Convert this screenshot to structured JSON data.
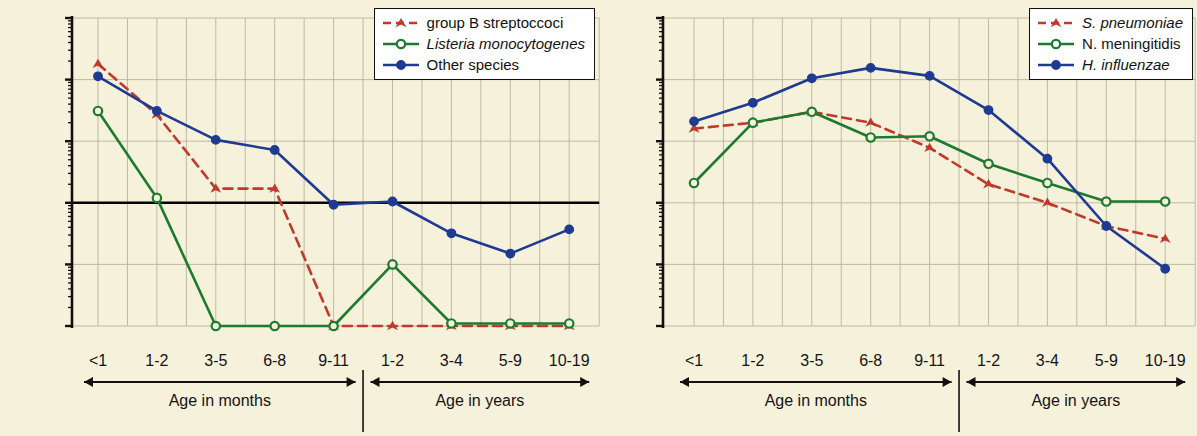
{
  "figure": {
    "background_color": "#f6f1db",
    "ylabel": "Incidence/100,000",
    "yticks": [
      "1000",
      "100",
      "10",
      "1",
      "0.1",
      "0.01"
    ],
    "ylim": [
      0.01,
      1000
    ],
    "group_label_months": "Age in months",
    "group_label_years": "Age in years",
    "categories_months": [
      "<1",
      "1-2",
      "3-5",
      "6-8",
      "9-11"
    ],
    "categories_years": [
      "1-2",
      "3-4",
      "5-9",
      "10-19"
    ],
    "colors": {
      "red": "#c0392b",
      "green": "#1d7a2e",
      "blue": "#1f3a93",
      "grid": "#b9b29a",
      "axis": "#111111",
      "reference_line": "#000000"
    }
  },
  "chart_data": [
    {
      "type": "line",
      "panel": "left",
      "title": "",
      "xlabel": "Age in months / Age in years",
      "ylabel": "Incidence/100,000",
      "log_y": true,
      "ylim": [
        0.01,
        1000
      ],
      "yticks": [
        0.01,
        0.1,
        1,
        10,
        100,
        1000
      ],
      "grid": true,
      "reference_line_y": 1,
      "legend_position": "top-right",
      "categories": [
        "<1",
        "1-2",
        "3-5",
        "6-8",
        "9-11",
        "1-2",
        "3-4",
        "5-9",
        "10-19"
      ],
      "category_groups": [
        "months",
        "months",
        "months",
        "months",
        "months",
        "years",
        "years",
        "years",
        "years"
      ],
      "series": [
        {
          "name": "group B streptoccoci",
          "color": "#c0392b",
          "line_style": "dashed",
          "marker": "triangle-filled",
          "values": [
            180,
            27,
            1.7,
            1.7,
            0.01,
            0.01,
            0.01,
            0.01,
            0.01
          ]
        },
        {
          "name": "Listeria monocytogenes",
          "color": "#1d7a2e",
          "line_style": "solid",
          "marker": "circle-open",
          "italic": true,
          "values": [
            31,
            1.2,
            0.01,
            0.01,
            0.01,
            0.1,
            0.011,
            0.011,
            0.011
          ]
        },
        {
          "name": "Other species",
          "color": "#1f3a93",
          "line_style": "solid",
          "marker": "circle-filled",
          "values": [
            113,
            31,
            10.5,
            7.2,
            0.93,
            1.05,
            0.32,
            0.15,
            0.37
          ]
        }
      ]
    },
    {
      "type": "line",
      "panel": "right",
      "title": "",
      "xlabel": "Age in months / Age in years",
      "ylabel": "Incidence/100,000",
      "log_y": true,
      "ylim": [
        0.01,
        1000
      ],
      "yticks": [
        0.01,
        0.1,
        1,
        10,
        100,
        1000
      ],
      "grid": true,
      "legend_position": "top-right",
      "categories": [
        "<1",
        "1-2",
        "3-5",
        "6-8",
        "9-11",
        "1-2",
        "3-4",
        "5-9",
        "10-19"
      ],
      "category_groups": [
        "months",
        "months",
        "months",
        "months",
        "months",
        "years",
        "years",
        "years",
        "years"
      ],
      "series": [
        {
          "name": "S. pneumoniae",
          "color": "#c0392b",
          "line_style": "dashed",
          "marker": "triangle-filled",
          "italic": true,
          "values": [
            16,
            20,
            30,
            20,
            7.8,
            2.0,
            1.0,
            0.42,
            0.26
          ]
        },
        {
          "name": "N. meningitidis",
          "color": "#1d7a2e",
          "line_style": "solid",
          "marker": "circle-open",
          "values": [
            2.1,
            20,
            30,
            11.5,
            12,
            4.3,
            2.1,
            1.05,
            1.05
          ]
        },
        {
          "name": "H. influenzae",
          "color": "#1f3a93",
          "line_style": "solid",
          "marker": "circle-filled",
          "italic": true,
          "values": [
            21,
            42,
            105,
            155,
            115,
            32,
            5.2,
            0.42,
            0.085
          ]
        }
      ]
    }
  ],
  "legends": [
    {
      "panel": "left",
      "entries": [
        {
          "label": "group B streptoccoci",
          "italic": false,
          "color": "#c0392b",
          "style": "dashed",
          "marker": "triangle-filled"
        },
        {
          "label": "Listeria monocytogenes",
          "italic": true,
          "color": "#1d7a2e",
          "style": "solid",
          "marker": "circle-open"
        },
        {
          "label": "Other species",
          "italic": false,
          "color": "#1f3a93",
          "style": "solid",
          "marker": "circle-filled"
        }
      ]
    },
    {
      "panel": "right",
      "entries": [
        {
          "label": "S. pneumoniae",
          "italic": true,
          "color": "#c0392b",
          "style": "dashed",
          "marker": "triangle-filled"
        },
        {
          "label": "N. meningitidis",
          "italic": false,
          "color": "#1d7a2e",
          "style": "solid",
          "marker": "circle-open"
        },
        {
          "label": "H. influenzae",
          "italic": true,
          "color": "#1f3a93",
          "style": "solid",
          "marker": "circle-filled"
        }
      ]
    }
  ]
}
